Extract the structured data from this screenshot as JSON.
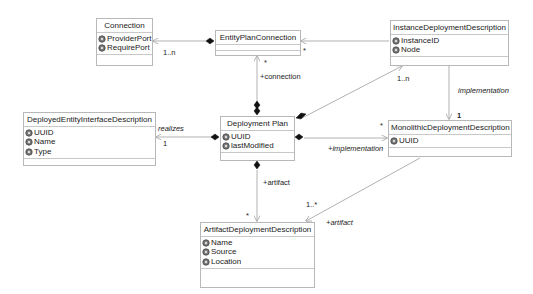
{
  "diagram": {
    "type": "UML class diagram",
    "classes": {
      "connection": {
        "name": "Connection",
        "attributes": [
          "ProviderPort",
          "RequirePort"
        ]
      },
      "entity_plan_connection": {
        "name": "EntityPlanConnection",
        "attributes": []
      },
      "instance_deployment_description": {
        "name": "InstanceDeploymentDescription",
        "attributes": [
          "InstanceID",
          "Node"
        ]
      },
      "deployed_entity_interface_description": {
        "name": "DeployedEntityInterfaceDescription",
        "attributes": [
          "UUID",
          "Name",
          "Type"
        ]
      },
      "deployment_plan": {
        "name": "Deployment Plan",
        "attributes": [
          "UUID",
          "lastModified"
        ]
      },
      "monolithic_deployment_description": {
        "name": "MonolithicDeploymentDescription",
        "attributes": [
          "UUID"
        ]
      },
      "artifact_deployment_description": {
        "name": "ArtifactDeploymentDescription",
        "attributes": [
          "Name",
          "Source",
          "Location"
        ]
      }
    },
    "relationships": [
      {
        "from": "EntityPlanConnection",
        "to": "Connection",
        "kind": "composition",
        "multiplicity": "1..n"
      },
      {
        "from": "EntityPlanConnection",
        "to": "InstanceDeploymentDescription",
        "kind": "association",
        "multiplicity": "*"
      },
      {
        "from": "Deployment Plan",
        "to": "EntityPlanConnection",
        "kind": "composition",
        "role": "+connection",
        "multiplicity": "*"
      },
      {
        "from": "Deployment Plan",
        "to": "DeployedEntityInterfaceDescription",
        "kind": "composition",
        "role": "realizes",
        "multiplicity": "1"
      },
      {
        "from": "Deployment Plan",
        "to": "InstanceDeploymentDescription",
        "kind": "composition",
        "multiplicity": "1..n"
      },
      {
        "from": "Deployment Plan",
        "to": "MonolithicDeploymentDescription",
        "kind": "composition",
        "role": "+implementation",
        "multiplicity": "*"
      },
      {
        "from": "InstanceDeploymentDescription",
        "to": "MonolithicDeploymentDescription",
        "kind": "association",
        "role": "implementation",
        "multiplicity": "1"
      },
      {
        "from": "Deployment Plan",
        "to": "ArtifactDeploymentDescription",
        "kind": "composition",
        "role": "+artifact",
        "multiplicity": "*"
      },
      {
        "from": "MonolithicDeploymentDescription",
        "to": "ArtifactDeploymentDescription",
        "kind": "association",
        "role": "+artifact",
        "multiplicity": "1..*"
      }
    ],
    "labels": {
      "conn_mult": "1..n",
      "epc_star": "*",
      "epc_down_star": "*",
      "connection_role": "+connection",
      "idd_mult": "1..n",
      "implementation_role": "implementation",
      "mdd_one": "1",
      "realizes_role": "realizes",
      "realizes_mult": "1",
      "mdd_star": "*",
      "plus_implementation": "+implementation",
      "artifact_role": "+artifact",
      "artifact_star": "*",
      "artifact_mult": "1..*",
      "artifact_role2": "+artifact"
    }
  }
}
